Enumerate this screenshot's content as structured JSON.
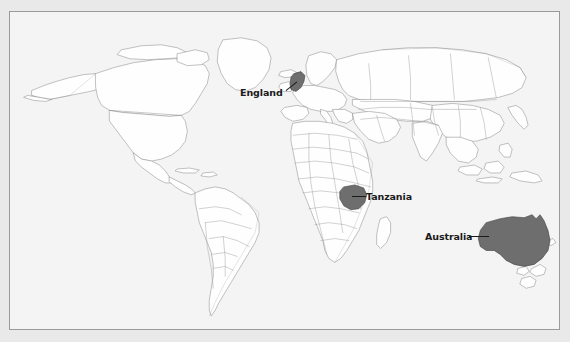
{
  "figure": {
    "type": "world-map",
    "frame": {
      "visible": true,
      "border_color": "#7d7d7d"
    }
  },
  "colors": {
    "page_background": "#e9e9e9",
    "ocean": "#f4f4f4",
    "land_fill": "#fefefe",
    "country_border": "#9a9a9a",
    "coastline": "#555555",
    "highlight_fill": "#6e6e6e",
    "highlight_border": "#3d3d3d",
    "label_text": "#1a1a1a",
    "leader_line": "#1a1a1a"
  },
  "annotations": [
    {
      "id": "england",
      "label": "England",
      "leader_line": true,
      "points_to": "United Kingdom",
      "highlighted": true
    },
    {
      "id": "tanzania",
      "label": "Tanzania",
      "leader_line": true,
      "points_to": "Tanzania",
      "highlighted": true
    },
    {
      "id": "australia",
      "label": "Australia",
      "leader_line": true,
      "points_to": "Australia",
      "highlighted": true
    }
  ],
  "highlighted_countries": [
    "England",
    "Tanzania",
    "Australia"
  ],
  "map_features": {
    "projection": "equirectangular-like world map",
    "continents_shown": [
      "North America",
      "South America",
      "Europe",
      "Africa",
      "Asia",
      "Australia"
    ],
    "antarctica_shown": false,
    "country_borders_shown": true,
    "graticule_shown": false,
    "legend_shown": false,
    "title_shown": false,
    "scale_bar_shown": false
  }
}
